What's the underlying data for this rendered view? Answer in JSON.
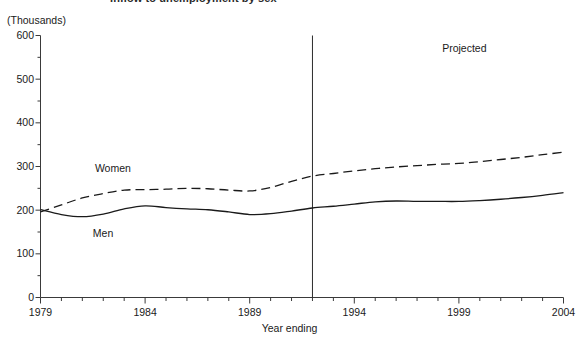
{
  "chart_data": {
    "type": "line",
    "title": "Inflow to unemployment by sex",
    "unit_label": "(Thousands)",
    "xlabel": "Year ending",
    "ylabel": "",
    "xlim": [
      1979,
      2004
    ],
    "ylim": [
      0,
      600
    ],
    "ytick_step": 100,
    "yminor_step": 50,
    "xtick_step": 1,
    "xlabel_step": 5,
    "grid": false,
    "legend_position": "inline-labels",
    "yticks": [
      0,
      100,
      200,
      300,
      400,
      500,
      600
    ],
    "ytick_labels": [
      "0",
      "100",
      "200",
      "300",
      "400",
      "500",
      "600"
    ],
    "xticks": [
      1979,
      1984,
      1989,
      1994,
      1999,
      2004
    ],
    "xtick_labels": [
      "1979",
      "1984",
      "1989",
      "1994",
      "1999",
      "2004"
    ],
    "x": [
      1979,
      1980,
      1981,
      1982,
      1983,
      1984,
      1985,
      1986,
      1987,
      1988,
      1989,
      1990,
      1991,
      1992,
      1993,
      1994,
      1995,
      1996,
      1997,
      1998,
      1999,
      2000,
      2001,
      2002,
      2003,
      2004
    ],
    "series": [
      {
        "name": "Women",
        "style": "dashed",
        "color": "#1a1a1a",
        "label_x": 1981.6,
        "label_y": 296,
        "values": [
          196,
          212,
          228,
          238,
          246,
          247,
          248,
          250,
          249,
          246,
          244,
          252,
          266,
          278,
          284,
          290,
          295,
          299,
          302,
          305,
          307,
          311,
          316,
          321,
          327,
          333
        ]
      },
      {
        "name": "Men",
        "style": "solid",
        "color": "#1a1a1a",
        "label_x": 1981.5,
        "label_y": 148,
        "values": [
          201,
          190,
          185,
          191,
          203,
          210,
          206,
          203,
          201,
          196,
          190,
          192,
          198,
          205,
          209,
          214,
          219,
          221,
          220,
          220,
          220,
          222,
          225,
          229,
          234,
          240
        ]
      }
    ],
    "annotations": [
      {
        "name": "projection-divider",
        "type": "vline",
        "x": 1992,
        "label": "Projected",
        "label_x": 1998.2,
        "label_y": 572
      }
    ]
  },
  "labels": {
    "projected": "Projected"
  }
}
